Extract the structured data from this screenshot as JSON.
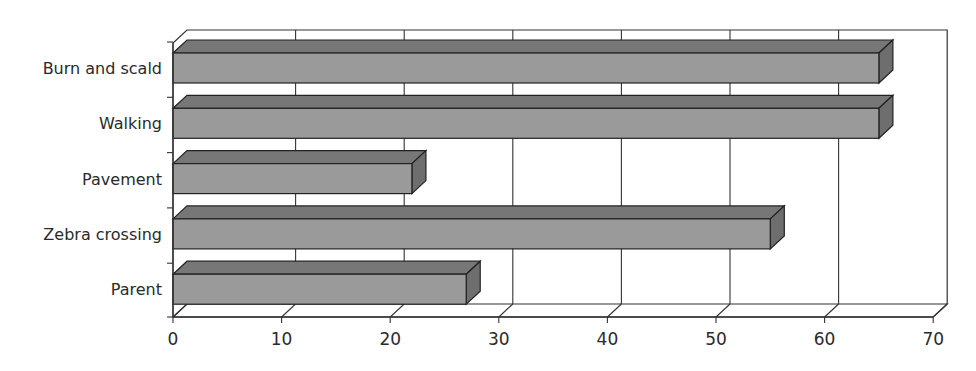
{
  "chart_data": {
    "type": "bar",
    "orientation": "horizontal",
    "style": "3d",
    "title": "",
    "xlabel": "",
    "ylabel": "",
    "categories": [
      "Burn and scald",
      "Walking",
      "Pavement",
      "Zebra crossing",
      "Parent"
    ],
    "values": [
      65,
      65,
      22,
      55,
      27
    ],
    "xlim": [
      0,
      70
    ],
    "x_ticks": [
      0,
      10,
      20,
      30,
      40,
      50,
      60,
      70
    ],
    "grid": "vertical",
    "legend": "none",
    "colors": {
      "bar_front": "#9a9a9a",
      "bar_top": "#777777",
      "bar_side": "#6e6e6e",
      "outline": "#222222",
      "grid": "#333333"
    }
  }
}
